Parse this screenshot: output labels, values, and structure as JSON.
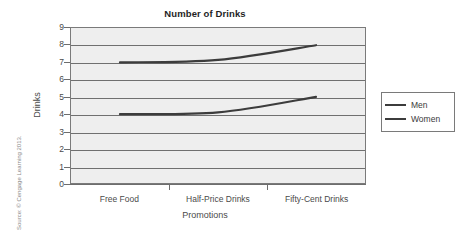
{
  "chart_data": {
    "type": "line",
    "title": "Number of Drinks",
    "xlabel": "Promotions",
    "ylabel": "Drinks",
    "categories": [
      "Free Food",
      "Half-Price Drinks",
      "Fifty-Cent Drinks"
    ],
    "series": [
      {
        "name": "Men",
        "values": [
          7,
          7.15,
          8
        ],
        "color": "#3c3c3c"
      },
      {
        "name": "Women",
        "values": [
          4,
          4.1,
          5
        ],
        "color": "#3c3c3c"
      }
    ],
    "ylim": [
      0,
      9
    ],
    "yticks": [
      0,
      1,
      2,
      3,
      4,
      5,
      6,
      7,
      8,
      9
    ],
    "ytick_labels": [
      "0",
      "1",
      "2",
      "3",
      "4",
      "5",
      "6",
      "7",
      "8",
      "9"
    ],
    "grid": true,
    "grid_axis": "y",
    "legend_position": "right",
    "plot_background": "#eeeeee",
    "line_color": "#3c3c3c"
  },
  "legend": {
    "entries": [
      {
        "label": "Men"
      },
      {
        "label": "Women"
      }
    ]
  },
  "source": {
    "text": "Source: © Cengage Learning 2013."
  }
}
